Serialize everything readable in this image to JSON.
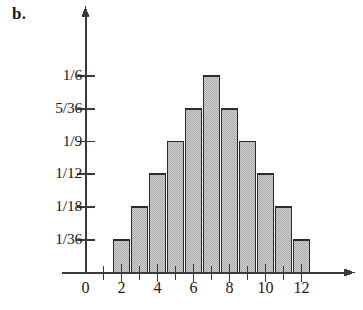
{
  "figure": {
    "label": "b.",
    "caption": ""
  },
  "chart_data": {
    "type": "bar",
    "title": "",
    "xlabel": "",
    "ylabel": "",
    "categories": [
      "2",
      "3",
      "4",
      "5",
      "6",
      "7",
      "8",
      "9",
      "10",
      "11",
      "12"
    ],
    "values": [
      0.027778,
      0.055556,
      0.083333,
      0.111111,
      0.138889,
      0.166667,
      0.138889,
      0.111111,
      0.083333,
      0.055556,
      0.027778
    ],
    "value_labels": [
      "1/36",
      "1/18",
      "1/12",
      "1/9",
      "5/36",
      "1/6",
      "5/36",
      "1/9",
      "1/12",
      "1/18",
      "1/36"
    ],
    "x": [
      2,
      3,
      4,
      5,
      6,
      7,
      8,
      9,
      10,
      11,
      12
    ],
    "xlim": [
      0,
      13
    ],
    "ylim": [
      0,
      0.1805
    ],
    "grid": false,
    "legend": null,
    "y_ticks": [
      {
        "label": "1/36",
        "value": 0.027778
      },
      {
        "label": "1/18",
        "value": 0.055556
      },
      {
        "label": "1/12",
        "value": 0.083333
      },
      {
        "label": "1/9",
        "value": 0.111111
      },
      {
        "label": "5/36",
        "value": 0.138889
      },
      {
        "label": "1/6",
        "value": 0.166667
      }
    ],
    "x_ticks_major": [
      "0",
      "2",
      "4",
      "6",
      "8",
      "10",
      "12"
    ],
    "x_ticks_major_values": [
      0,
      2,
      4,
      6,
      8,
      10,
      12
    ],
    "x_ticks_minor_values": [
      1,
      3,
      5,
      7,
      9,
      11
    ],
    "bar_fill_color": "#bfbfbf",
    "bar_edge_color": "#2b2b2b",
    "axis_color": "#3a3a3a",
    "background_color": "#ffffff"
  }
}
